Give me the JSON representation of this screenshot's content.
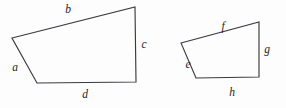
{
  "figure": {
    "type": "geometry-diagram",
    "background_color": "#fdfdfd",
    "stroke_color": "#3a3a42",
    "label_color": "#1d1d22",
    "shapes": [
      {
        "name": "quadrilateral-left",
        "points": "12,38 135,7 136,82 37,83",
        "vertices": [
          {
            "x": 12,
            "y": 38
          },
          {
            "x": 135,
            "y": 7
          },
          {
            "x": 136,
            "y": 82
          },
          {
            "x": 37,
            "y": 83
          }
        ],
        "labels": [
          {
            "id": "a",
            "text": "a",
            "x": 15,
            "y": 68
          },
          {
            "id": "b",
            "text": "b",
            "x": 68,
            "y": 10
          },
          {
            "id": "c",
            "text": "c",
            "x": 144,
            "y": 45
          },
          {
            "id": "d",
            "text": "d",
            "x": 85,
            "y": 95
          }
        ]
      },
      {
        "name": "quadrilateral-right",
        "points": "181,43 259,22 259,77 196,78",
        "vertices": [
          {
            "x": 181,
            "y": 43
          },
          {
            "x": 259,
            "y": 22
          },
          {
            "x": 259,
            "y": 77
          },
          {
            "x": 196,
            "y": 78
          }
        ],
        "labels": [
          {
            "id": "e",
            "text": "e",
            "x": 188,
            "y": 65
          },
          {
            "id": "f",
            "text": "f",
            "x": 223,
            "y": 27
          },
          {
            "id": "g",
            "text": "g",
            "x": 267,
            "y": 50
          },
          {
            "id": "h",
            "text": "h",
            "x": 232,
            "y": 93
          }
        ]
      }
    ]
  }
}
